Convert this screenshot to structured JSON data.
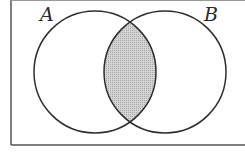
{
  "diagram": {
    "type": "venn",
    "sets": [
      {
        "label": "A",
        "cx": 95,
        "cy": 72,
        "r": 61
      },
      {
        "label": "B",
        "cx": 165,
        "cy": 72,
        "r": 61
      }
    ],
    "shaded_region": "A ∩ B",
    "colors": {
      "stroke": "#2e2e2e",
      "frame": "#555555",
      "shade": "#c8c8c8",
      "background": "#ffffff"
    }
  }
}
